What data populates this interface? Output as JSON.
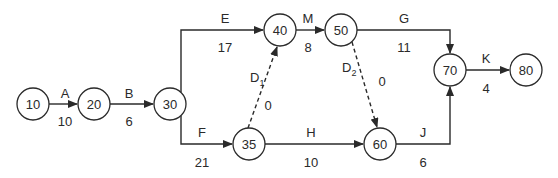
{
  "diagram": {
    "type": "activity-on-arrow network",
    "nodes": [
      {
        "id": "10",
        "label": "10",
        "x": 33,
        "y": 104
      },
      {
        "id": "20",
        "label": "20",
        "x": 94,
        "y": 104
      },
      {
        "id": "30",
        "label": "30",
        "x": 170,
        "y": 104
      },
      {
        "id": "40",
        "label": "40",
        "x": 280,
        "y": 30
      },
      {
        "id": "50",
        "label": "50",
        "x": 341,
        "y": 30
      },
      {
        "id": "35",
        "label": "35",
        "x": 249,
        "y": 144
      },
      {
        "id": "60",
        "label": "60",
        "x": 380,
        "y": 144
      },
      {
        "id": "70",
        "label": "70",
        "x": 450,
        "y": 70
      },
      {
        "id": "80",
        "label": "80",
        "x": 526,
        "y": 70
      }
    ],
    "activities": [
      {
        "name": "A",
        "from": "10",
        "to": "20",
        "duration": "10",
        "dummy": false
      },
      {
        "name": "B",
        "from": "20",
        "to": "30",
        "duration": "6",
        "dummy": false
      },
      {
        "name": "E",
        "from": "30",
        "to": "40",
        "duration": "17",
        "dummy": false
      },
      {
        "name": "F",
        "from": "30",
        "to": "35",
        "duration": "21",
        "dummy": false
      },
      {
        "name": "M",
        "from": "40",
        "to": "50",
        "duration": "8",
        "dummy": false
      },
      {
        "name": "D1",
        "from": "35",
        "to": "40",
        "duration": "0",
        "dummy": true
      },
      {
        "name": "H",
        "from": "35",
        "to": "60",
        "duration": "10",
        "dummy": false
      },
      {
        "name": "D2",
        "from": "50",
        "to": "60",
        "duration": "0",
        "dummy": true
      },
      {
        "name": "G",
        "from": "50",
        "to": "70",
        "duration": "11",
        "dummy": false
      },
      {
        "name": "J",
        "from": "60",
        "to": "70",
        "duration": "6",
        "dummy": false
      },
      {
        "name": "K",
        "from": "70",
        "to": "80",
        "duration": "4",
        "dummy": false
      }
    ],
    "labels": {
      "A": "A",
      "A_dur": "10",
      "B": "B",
      "B_dur": "6",
      "E": "E",
      "E_dur": "17",
      "F": "F",
      "F_dur": "21",
      "M": "M",
      "M_dur": "8",
      "D1": "D",
      "D1_sub": "1",
      "D1_dur": "0",
      "H": "H",
      "H_dur": "10",
      "D2": "D",
      "D2_sub": "2",
      "D2_dur": "0",
      "G": "G",
      "G_dur": "11",
      "J": "J",
      "J_dur": "6",
      "K": "K",
      "K_dur": "4"
    }
  }
}
